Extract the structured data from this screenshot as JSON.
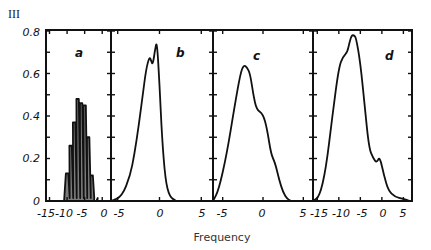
{
  "figure_label": "III",
  "chart_data": [
    {
      "type": "line",
      "panel": "a",
      "title": "a",
      "xlabel": "Frequency",
      "ylabel": "",
      "xticks": [
        -15,
        -10,
        -5,
        0
      ],
      "xlim": [
        -16,
        2.5
      ],
      "ylim": [
        0,
        0.8
      ],
      "yticks": [
        0,
        0.2,
        0.4,
        0.6,
        0.8
      ],
      "grid": false,
      "style": "spikes",
      "x": [
        -10,
        -9,
        -8,
        -7,
        -6,
        -5,
        -4,
        -3,
        -2
      ],
      "y": [
        0.13,
        0.26,
        0.37,
        0.48,
        0.46,
        0.45,
        0.3,
        0.12,
        0.0
      ]
    },
    {
      "type": "line",
      "panel": "b",
      "title": "b",
      "xlabel": "Frequency",
      "xticks": [
        -5,
        0,
        5
      ],
      "xlim": [
        -5.8,
        6.4
      ],
      "ylim": [
        0,
        0.8
      ],
      "grid": false,
      "x": [
        -5.8,
        -4.5,
        -3.5,
        -3.0,
        -2.5,
        -2.0,
        -1.6,
        -1.2,
        -1.0,
        -0.8,
        -0.5,
        -0.3,
        0.0,
        0.3,
        0.7,
        1.2,
        2.0
      ],
      "y": [
        0.0,
        0.02,
        0.12,
        0.22,
        0.35,
        0.5,
        0.62,
        0.68,
        0.66,
        0.64,
        0.72,
        0.75,
        0.55,
        0.3,
        0.1,
        0.02,
        0.0
      ]
    },
    {
      "type": "line",
      "panel": "c",
      "title": "c",
      "xlabel": "Frequency",
      "xticks": [
        -5,
        0,
        5
      ],
      "xlim": [
        -6.2,
        6.2
      ],
      "ylim": [
        0,
        0.8
      ],
      "grid": false,
      "x": [
        -6.2,
        -5.5,
        -4.5,
        -3.5,
        -2.8,
        -2.4,
        -2.0,
        -1.6,
        -1.2,
        -0.8,
        0.0,
        0.5,
        1.0,
        1.5,
        2.0,
        2.5,
        3.0,
        3.5
      ],
      "y": [
        0.0,
        0.05,
        0.22,
        0.45,
        0.6,
        0.64,
        0.63,
        0.6,
        0.5,
        0.43,
        0.41,
        0.34,
        0.22,
        0.18,
        0.1,
        0.04,
        0.01,
        0.0
      ]
    },
    {
      "type": "line",
      "panel": "d",
      "title": "d",
      "xlabel": "Frequency",
      "xticks": [
        -15,
        -10,
        -5,
        0,
        5
      ],
      "xlim": [
        -16,
        7
      ],
      "ylim": [
        0,
        0.8
      ],
      "grid": false,
      "x": [
        -16,
        -14.5,
        -13,
        -11.5,
        -10,
        -9,
        -8,
        -7.5,
        -7,
        -6.5,
        -6,
        -5,
        -4,
        -3,
        -2,
        -1.2,
        -0.5,
        0.5,
        1.5,
        3,
        5,
        6.5
      ],
      "y": [
        0.0,
        0.02,
        0.15,
        0.4,
        0.63,
        0.68,
        0.7,
        0.75,
        0.78,
        0.78,
        0.77,
        0.65,
        0.45,
        0.25,
        0.2,
        0.18,
        0.21,
        0.12,
        0.05,
        0.02,
        0.01,
        0.0
      ]
    }
  ],
  "axes": {
    "y_tick_labels": [
      "0",
      "0.2",
      "0.4",
      "0.6",
      "0.8"
    ],
    "x_tick_labels_a": [
      "-15",
      "-10",
      "-5",
      "0"
    ],
    "x_tick_labels_b": [
      "-5",
      "0",
      "5"
    ],
    "x_tick_labels_c": [
      "-5",
      "0",
      "5"
    ],
    "x_tick_labels_d": [
      "-15",
      "-10",
      "-5",
      "0",
      "5"
    ],
    "xlabel": "Frequency"
  }
}
